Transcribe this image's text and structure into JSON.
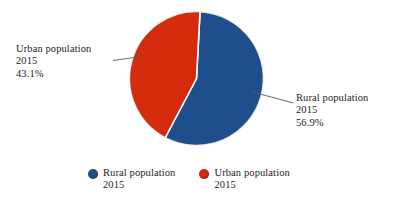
{
  "chart_data": {
    "type": "pie",
    "title": "",
    "categories": [
      "Rural population 2015",
      "Urban population 2015"
    ],
    "values": [
      56.9,
      43.1
    ],
    "value_unit": "%",
    "legend_position": "bottom",
    "grid": false,
    "slices": [
      {
        "name": "Rural population",
        "year": "2015",
        "percent": "56.9%",
        "value": 56.9,
        "color": "#1f4e8c",
        "start_angle_deg": 3,
        "sweep_deg": 204.84
      },
      {
        "name": "Urban population",
        "year": "2015",
        "percent": "43.1%",
        "value": 43.1,
        "color": "#d32b0b",
        "start_angle_deg": 207.84,
        "sweep_deg": 155.16
      }
    ]
  },
  "callouts": {
    "left": {
      "name": "Urban population",
      "year": "2015",
      "percent": "43.1%"
    },
    "right": {
      "name": "Rural population",
      "year": "2015",
      "percent": "56.9%"
    }
  },
  "legend": {
    "items": [
      {
        "label": "Rural population",
        "sublabel": "2015",
        "color": "#1f4e8c",
        "marker": "circle-marker"
      },
      {
        "label": "Urban population",
        "sublabel": "2015",
        "color": "#d32b0b",
        "marker": "circle-marker"
      }
    ]
  },
  "colors": {
    "rural": "#1f4e8c",
    "urban": "#d32b0b",
    "text": "#1d1d1d",
    "leader_line": "#5a5a5a",
    "background": "#ffffff"
  }
}
